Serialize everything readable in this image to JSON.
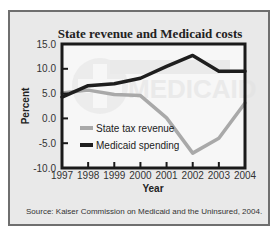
{
  "chart_data": {
    "type": "line",
    "title": "State revenue and Medicaid costs",
    "xlabel": "Year",
    "ylabel": "Percent",
    "x": [
      1997,
      1998,
      1999,
      2000,
      2001,
      2002,
      2003,
      2004
    ],
    "ylim": [
      -10.0,
      15.0
    ],
    "yticks": [
      "15.0",
      "10.0",
      "5.0",
      "0.0",
      "-5.0",
      "-10.0"
    ],
    "xticks": [
      "1997",
      "1998",
      "1999",
      "2000",
      "2001",
      "2002",
      "2003",
      "2004"
    ],
    "grid": false,
    "legend_position": "inside-lower-left",
    "series": [
      {
        "name": "State tax revenue",
        "color": "#a9a9a9",
        "values": [
          5.1,
          5.7,
          4.8,
          4.6,
          0.1,
          -7.0,
          -4.0,
          3.1
        ]
      },
      {
        "name": "Medicaid spending",
        "color": "#1e1e1e",
        "values": [
          4.3,
          6.6,
          7.0,
          8.1,
          10.5,
          12.7,
          9.5,
          9.5
        ]
      }
    ],
    "watermark": "MEDICAID",
    "source": "Source: Kaiser Commission on Medicaid and the Uninsured, 2004."
  }
}
